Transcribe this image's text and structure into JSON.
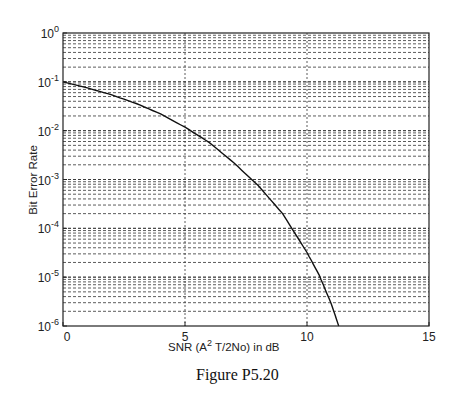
{
  "chart_data": {
    "type": "line",
    "title": "",
    "xlabel": "SNR (A^2 T/2No) in dB",
    "xlabel_main": "SNR (A",
    "xlabel_sup": "2",
    "xlabel_rest": " T/2No) in dB",
    "ylabel": "Bit Error Rate",
    "xlim": [
      0,
      15
    ],
    "ylim": [
      1e-06,
      1
    ],
    "yscale": "log",
    "grid": true,
    "x_ticks": [
      0,
      5,
      10,
      15
    ],
    "x_tick_labels": [
      "0",
      "5",
      "10",
      "15"
    ],
    "y_ticks": [
      1,
      0.1,
      0.01,
      0.001,
      0.0001,
      1e-05,
      1e-06
    ],
    "y_tick_labels": [
      {
        "base": "10",
        "exp": "0"
      },
      {
        "base": "10",
        "exp": "-1"
      },
      {
        "base": "10",
        "exp": "-2"
      },
      {
        "base": "10",
        "exp": "-3"
      },
      {
        "base": "10",
        "exp": "-4"
      },
      {
        "base": "10",
        "exp": "-5"
      },
      {
        "base": "10",
        "exp": "-6"
      }
    ],
    "series": [
      {
        "name": "BER",
        "x": [
          0,
          1,
          2,
          3,
          4,
          5,
          6,
          7,
          8,
          9,
          10,
          10.5,
          11,
          11.3
        ],
        "y": [
          0.1,
          0.075,
          0.054,
          0.036,
          0.022,
          0.0118,
          0.0057,
          0.0022,
          0.00075,
          0.0002,
          3.2e-05,
          1.1e-05,
          2.8e-06,
          1e-06
        ]
      }
    ],
    "legend": null
  },
  "caption": "Figure P5.20"
}
